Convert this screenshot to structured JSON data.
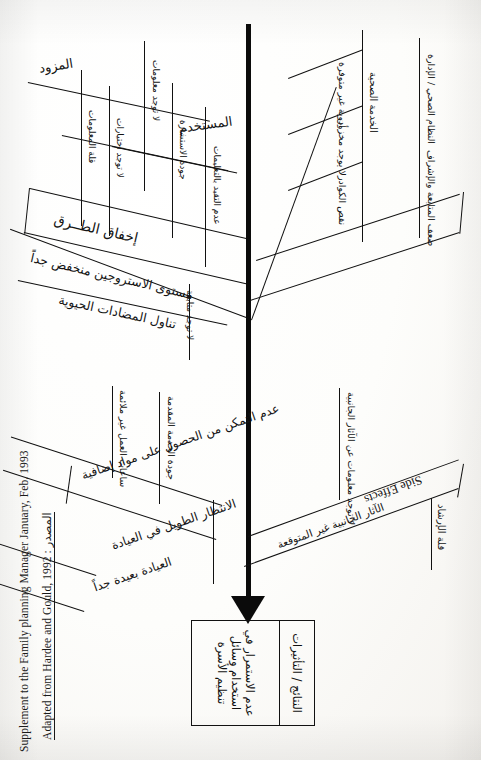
{
  "document": {
    "kind": "scanned-page",
    "title": "Fishbone (cause and effect) diagram - Arabic",
    "orientation": "rotated-90-ccw",
    "language": "ar",
    "ink_color": "#111111",
    "paper_color": "#fbfaf8"
  },
  "diagram": {
    "type": "fishbone",
    "spine_label": "",
    "english_label": "Side Effects",
    "categories": [
      {
        "id": "supply",
        "label": "المزود",
        "side": "upper-left",
        "causes": [
          "قلة المعلومات",
          "لا توجد اختيارات",
          "عدم تقديم الاستشارة",
          "الانتظار الطويل"
        ]
      },
      {
        "id": "user",
        "label": "المستخدم",
        "side": "upper-left",
        "causes": [
          "لا توجد معلومات",
          "جودة الاستشارة",
          "عدم التقيد بالتعليمات"
        ]
      },
      {
        "id": "methods",
        "label": "إخفاق الطــرق",
        "side": "lower-left",
        "causes": [
          "مستوى الاستروجين منخفض جداً",
          "تناول المضادات الحيوية",
          "لا توجد متابعة"
        ]
      },
      {
        "id": "services",
        "label": "الخدمة الصحية",
        "side": "upper-right",
        "causes": [
          "أدوية غير متوفرة",
          "لا يوجد مخزون",
          "نقص الكوادر"
        ]
      },
      {
        "id": "system",
        "label": "النظام الصحي / الإدارة",
        "side": "right",
        "causes": [
          "ضعف المتابعة والإشراف"
        ]
      },
      {
        "id": "access",
        "label": "الوصول إلى الخدمة",
        "side": "lower-left",
        "causes": [
          "عدم التمكن من الحصول على مواد إضافية",
          "الانتظار الطويل في العيادة",
          "العيادة بعيدة جداً",
          "جودة الخدمة المقدمة",
          "ساعات العمل غير ملائمة"
        ]
      },
      {
        "id": "side-effects",
        "label": "قلة الإرشاد",
        "side": "lower-right",
        "causes": [
          "الآثار الجانبية غير المتوقعة",
          "لا توجد معلومات عن الآثار الجانبية"
        ]
      }
    ],
    "result_box": {
      "right_cell": "النتائج / التأثيرات",
      "left_cell": "عدم الاستمرار في استخدام وسائل تنظيم الأسرة"
    }
  },
  "credits": {
    "line1_en": "Adapted from Hardee and Gould, 1992 :",
    "line1_ar": "المصدر",
    "line2_en": "Supplement to the Family planning Manager January, Feb. 1993"
  }
}
